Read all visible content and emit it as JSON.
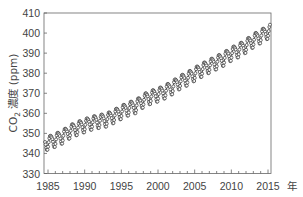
{
  "chart_data": {
    "type": "line",
    "title": "",
    "xlabel": "年",
    "ylabel": "CO2 濃度 (ppm)",
    "ylabel_parts": {
      "prefix": "CO",
      "subscript": "2",
      "suffix": " 濃度 (ppm)"
    },
    "xlim": [
      1984.5,
      2015.4
    ],
    "ylim": [
      330,
      410
    ],
    "x_ticks": [
      1985,
      1990,
      1995,
      2000,
      2005,
      2010,
      2015
    ],
    "x_tick_labels": [
      "1985",
      "1990",
      "1995",
      "2000",
      "2005",
      "2010",
      "2015"
    ],
    "x_unit_label": "年",
    "y_ticks": [
      330,
      340,
      350,
      360,
      370,
      380,
      390,
      400,
      410
    ],
    "y_tick_labels": [
      "330",
      "340",
      "350",
      "360",
      "370",
      "380",
      "390",
      "400",
      "410"
    ],
    "grid": false,
    "legend": null,
    "marker": "open-circle",
    "seasonal_amplitude_ppm": 3.2,
    "series": [
      {
        "name": "CO2 monthly concentration",
        "annual_mean_x": [
          1985,
          1986,
          1987,
          1988,
          1989,
          1990,
          1991,
          1992,
          1993,
          1994,
          1995,
          1996,
          1997,
          1998,
          1999,
          2000,
          2001,
          2002,
          2003,
          2004,
          2005,
          2006,
          2007,
          2008,
          2009,
          2010,
          2011,
          2012,
          2013,
          2014,
          2015
        ],
        "annual_mean_y": [
          345.5,
          346.9,
          348.6,
          351.2,
          352.8,
          354.2,
          355.5,
          356.3,
          357.0,
          358.8,
          360.8,
          362.6,
          363.7,
          366.6,
          368.3,
          369.5,
          371.1,
          373.2,
          375.8,
          377.5,
          379.8,
          381.9,
          383.8,
          385.6,
          387.4,
          389.9,
          391.6,
          393.8,
          396.5,
          398.6,
          400.8
        ]
      }
    ]
  },
  "colors": {
    "axis": "#666666",
    "line": "#444444",
    "marker_stroke": "#333333",
    "marker_fill": "#ffffff"
  }
}
